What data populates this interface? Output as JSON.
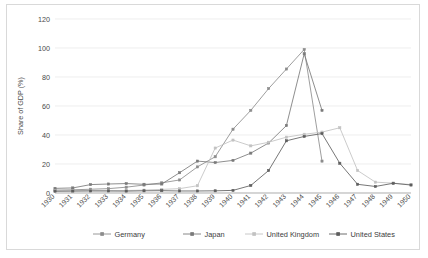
{
  "chart_data": {
    "type": "line",
    "title": "",
    "xlabel": "",
    "ylabel": "Share of GDP (%)",
    "ylim": [
      0,
      120
    ],
    "yticks": [
      0,
      20,
      40,
      60,
      80,
      100,
      120
    ],
    "ytick_labels": [
      "0",
      "20",
      "40",
      "60",
      "80",
      "100",
      "120"
    ],
    "grid": true,
    "legend_position": "bottom",
    "categories": [
      "1930",
      "1931",
      "1932",
      "1933",
      "1934",
      "1935",
      "1936",
      "1937",
      "1938",
      "1939",
      "1940",
      "1941",
      "1942",
      "1943",
      "1944",
      "1945",
      "1946",
      "1947",
      "1948",
      "1949",
      "1950"
    ],
    "series": [
      {
        "name": "Germany",
        "color": "#8c8c8c",
        "marker": "square",
        "values": [
          2.0,
          2.2,
          2.6,
          3.0,
          4.0,
          5.5,
          7.0,
          9.0,
          18.0,
          25.0,
          44.0,
          57.0,
          72.0,
          85.5,
          99.0,
          22.0,
          null,
          null,
          null,
          null,
          null
        ]
      },
      {
        "name": "Japan",
        "color": "#7a7a7a",
        "marker": "square",
        "values": [
          3.2,
          3.5,
          5.8,
          6.2,
          6.5,
          6.0,
          6.2,
          14.0,
          22.0,
          21.0,
          22.5,
          27.5,
          34.5,
          46.5,
          96.0,
          57.0,
          null,
          null,
          null,
          null,
          null
        ]
      },
      {
        "name": "United Kingdom",
        "color": "#c2c2c2",
        "marker": "square",
        "values": [
          1.5,
          1.6,
          1.7,
          1.6,
          1.7,
          2.0,
          2.5,
          3.0,
          5.0,
          31.0,
          36.5,
          32.5,
          35.0,
          38.5,
          40.5,
          42.0,
          45.0,
          15.5,
          7.5,
          6.8,
          5.8
        ]
      },
      {
        "name": "United States",
        "color": "#5e5e5e",
        "marker": "square",
        "values": [
          1.2,
          1.3,
          1.4,
          1.4,
          1.3,
          1.5,
          1.6,
          1.4,
          1.4,
          1.5,
          1.8,
          5.2,
          15.5,
          36.0,
          39.0,
          41.0,
          20.5,
          6.0,
          4.5,
          6.7,
          5.5
        ]
      }
    ]
  },
  "legend": {
    "items": [
      {
        "label": "Germany"
      },
      {
        "label": "Japan"
      },
      {
        "label": "United Kingdom"
      },
      {
        "label": "United States"
      }
    ]
  }
}
